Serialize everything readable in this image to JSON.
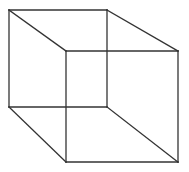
{
  "diagram": {
    "type": "wireframe-cube",
    "background": "#ffffff",
    "stroke_color": "#333333",
    "stroke_width": 1.3,
    "vertices": {
      "back_top_left": [
        9,
        10
      ],
      "back_top_right": [
        107,
        10
      ],
      "back_bottom_left": [
        9,
        107
      ],
      "back_bottom_right": [
        107,
        107
      ],
      "front_top_left": [
        66,
        51
      ],
      "front_top_right": [
        178,
        51
      ],
      "front_bottom_left": [
        66,
        162
      ],
      "front_bottom_right": [
        178,
        162
      ]
    },
    "edges": [
      [
        "back_top_left",
        "back_top_right"
      ],
      [
        "back_top_right",
        "back_bottom_right"
      ],
      [
        "back_bottom_right",
        "back_bottom_left"
      ],
      [
        "back_bottom_left",
        "back_top_left"
      ],
      [
        "front_top_left",
        "front_top_right"
      ],
      [
        "front_top_right",
        "front_bottom_right"
      ],
      [
        "front_bottom_right",
        "front_bottom_left"
      ],
      [
        "front_bottom_left",
        "front_top_left"
      ],
      [
        "back_top_left",
        "front_top_left"
      ],
      [
        "back_top_right",
        "front_top_right"
      ],
      [
        "back_bottom_left",
        "front_bottom_left"
      ],
      [
        "back_bottom_right",
        "front_bottom_right"
      ]
    ]
  }
}
